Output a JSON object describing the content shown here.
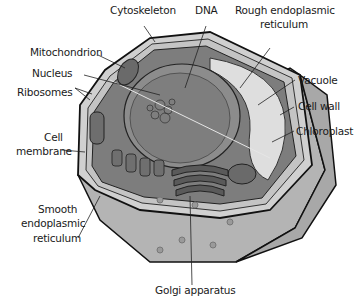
{
  "diagram": {
    "colors": {
      "outline": "#111111",
      "wall_face": "#b9b9b9",
      "wall_side": "#9c9c9c",
      "wall_top": "#d4d4d4",
      "cytoplasm": "#7c7c7c",
      "nucleus": "#8a8a8a",
      "vacuole": "#dcdcdc",
      "leader": "#222222"
    },
    "labels": [
      {
        "id": "cytoskeleton",
        "text": "Cytoskeleton"
      },
      {
        "id": "dna",
        "text": "DNA"
      },
      {
        "id": "rough_er_1",
        "text": "Rough endoplasmic"
      },
      {
        "id": "rough_er_2",
        "text": "reticulum"
      },
      {
        "id": "mitochondrion",
        "text": "Mitochondrion"
      },
      {
        "id": "nucleus",
        "text": "Nucleus"
      },
      {
        "id": "ribosomes",
        "text": "Ribosomes"
      },
      {
        "id": "vacuole",
        "text": "Vacuole"
      },
      {
        "id": "cell_wall",
        "text": "Cell wall"
      },
      {
        "id": "chloroplast",
        "text": "Chloroplast"
      },
      {
        "id": "cell_membrane_1",
        "text": "Cell"
      },
      {
        "id": "cell_membrane_2",
        "text": "membrane"
      },
      {
        "id": "smooth_er_1",
        "text": "Smooth"
      },
      {
        "id": "smooth_er_2",
        "text": "endoplasmic"
      },
      {
        "id": "smooth_er_3",
        "text": "reticulum"
      },
      {
        "id": "golgi",
        "text": "Golgi apparatus"
      }
    ]
  }
}
